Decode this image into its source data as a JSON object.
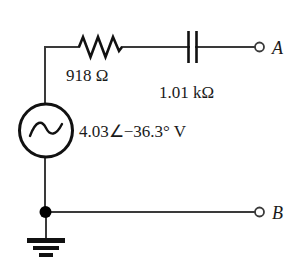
{
  "diagram": {
    "background_color": "#ffffff",
    "wire_color": "#3a3a3a",
    "component_color": "#111111",
    "width": 305,
    "height": 277
  },
  "components": {
    "source": {
      "name": "ac-voltage-source",
      "symbol": "sine-wave",
      "label": "4.03∠−36.3° V",
      "magnitude": "4.03",
      "angle": "−36.3°",
      "unit": "V"
    },
    "resistor": {
      "name": "resistor",
      "symbol": "zigzag",
      "label": "918 Ω",
      "value": "918",
      "unit": "Ω"
    },
    "capacitor": {
      "name": "capacitor",
      "symbol": "parallel-plates",
      "label": "1.01 kΩ",
      "value": "1.01",
      "unit": "kΩ"
    },
    "ground": {
      "name": "ground",
      "symbol": "earth-ground-3-bar",
      "label": ""
    },
    "node": {
      "name": "junction-node",
      "label": ""
    }
  },
  "terminals": [
    {
      "id": "A",
      "label": "A",
      "position": "top-right"
    },
    {
      "id": "B",
      "label": "B",
      "position": "bottom-right"
    }
  ]
}
